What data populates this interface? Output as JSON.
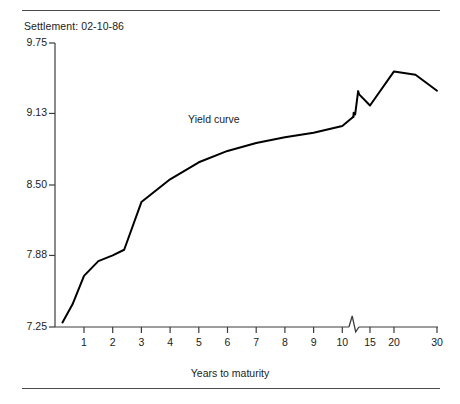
{
  "header": {
    "settlement_label": "Settlement: 02-10-86"
  },
  "axis_title": {
    "x": "Years to maturity"
  },
  "series_annotation": {
    "label": "Yield curve"
  },
  "colors": {
    "line": "#000000",
    "axis": "#3c3c3c",
    "rule": "#4a4a4a",
    "text": "#1b1b1b",
    "background": "#ffffff"
  },
  "chart_data": {
    "type": "line",
    "title": "",
    "subtitle": "Settlement: 02-10-86",
    "xlabel": "Years to maturity",
    "ylabel": "",
    "ylim": [
      7.25,
      9.75
    ],
    "xlim": [
      0,
      30
    ],
    "grid": false,
    "legend_position": "inline-annotation",
    "axis_break": {
      "axis": "x",
      "between": [
        10,
        15
      ],
      "style": "zigzag",
      "also_on_series": true
    },
    "yticks": [
      7.25,
      7.88,
      8.5,
      9.13,
      9.75
    ],
    "ytick_labels": [
      "7.25",
      "7.88",
      "8.50",
      "9.13",
      "9.75"
    ],
    "xticks": [
      1,
      2,
      3,
      4,
      5,
      6,
      7,
      8,
      9,
      10,
      15,
      20,
      30
    ],
    "xtick_labels": [
      "1",
      "2",
      "3",
      "4",
      "5",
      "6",
      "7",
      "8",
      "9",
      "10",
      "15",
      "20",
      "30"
    ],
    "annotations": [
      {
        "text": "Yield curve",
        "x": 5.6,
        "y": 9.07
      }
    ],
    "series": [
      {
        "name": "Yield curve",
        "x": [
          0.25,
          0.6,
          1.0,
          1.5,
          2.0,
          2.4,
          3.0,
          4.0,
          5.0,
          6.0,
          7.0,
          8.0,
          9.0,
          10.0,
          12.0,
          13.0,
          15.0,
          20.0,
          25.0,
          30.0
        ],
        "y": [
          7.29,
          7.45,
          7.7,
          7.83,
          7.88,
          7.93,
          8.35,
          8.55,
          8.7,
          8.8,
          8.87,
          8.92,
          8.96,
          9.02,
          9.1,
          9.3,
          9.2,
          9.5,
          9.47,
          9.33
        ]
      }
    ]
  }
}
